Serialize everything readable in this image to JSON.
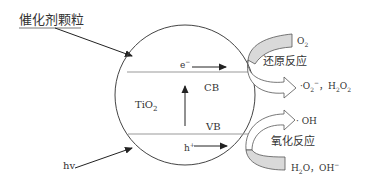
{
  "diagram": {
    "title_label": "催化剂颗粒",
    "light_label": "hv",
    "material_label": "TiO",
    "material_sub": "2",
    "conduction_band": "CB",
    "valence_band": "VB",
    "electron": "e",
    "electron_sup": "−",
    "hole": "h",
    "hole_sup": "+",
    "reduction": {
      "reactant": "O",
      "reactant_sub": "2",
      "label": "还原反应",
      "products_text": "·O",
      "products_sub1": "2",
      "products_sup1": "−",
      "products_sep": "，H",
      "products_sub2": "2",
      "products_mid": "O",
      "products_sub3": "2"
    },
    "oxidation": {
      "product": "· OH",
      "label": "氧化反应",
      "reactant_h": "H",
      "reactant_sub": "2",
      "reactant_rest": "O，OH",
      "reactant_sup": "−"
    }
  },
  "colors": {
    "stroke": "#333333",
    "band_line": "#999999",
    "arrow_fill": "#d9d9d9"
  }
}
